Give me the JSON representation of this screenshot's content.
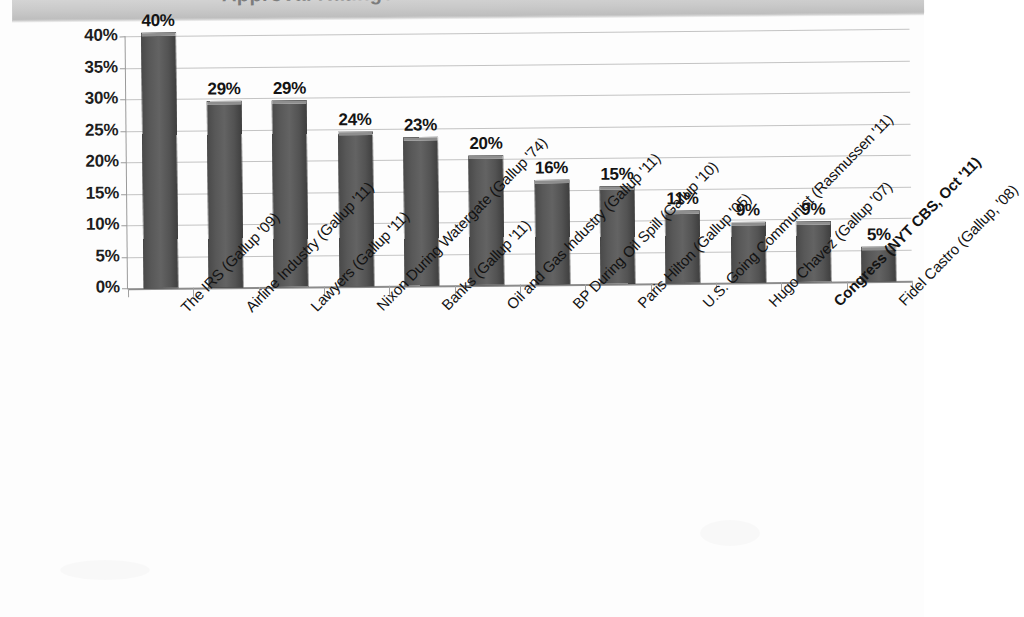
{
  "header": {
    "title_cropped": "Approval Ratings"
  },
  "chart_data": {
    "type": "bar",
    "title": "",
    "xlabel": "",
    "ylabel": "",
    "ylim": [
      0,
      40
    ],
    "ytick_labels": [
      "40%",
      "35%",
      "30%",
      "25%",
      "20%",
      "15%",
      "10%",
      "5%",
      "0%"
    ],
    "ytick_values": [
      40,
      35,
      30,
      25,
      20,
      15,
      10,
      5,
      0
    ],
    "grid": true,
    "legend": "none",
    "categories": [
      "The IRS (Gallup '09)",
      "Airline Industry (Gallup '11)",
      "Lawyers (Gallup '11)",
      "Nixon During Watergate (Gallup '74)",
      "Banks (Gallup '11)",
      "Oil and Gas Industry (Gallup '11)",
      "BP During Oil Spill (Gallup '10)",
      "Paris Hilton (Gallup '05)",
      "U.S. Going Communist (Rasmussen '11)",
      "Hugo Chavez (Gallup '07)",
      "Congress (NYT CBS, Oct '11)",
      "Fidel Castro (Gallup, '08)"
    ],
    "emphasized_category": "Congress (NYT CBS, Oct '11)",
    "values": [
      40,
      29,
      29,
      24,
      23,
      20,
      16,
      15,
      11,
      9,
      9,
      5
    ],
    "value_labels": [
      "40%",
      "29%",
      "29%",
      "24%",
      "23%",
      "20%",
      "16%",
      "15%",
      "11%",
      "9%",
      "9%",
      "5%"
    ],
    "bar_color": "#585858",
    "bar_cap_color": "#9d9d9d",
    "gridline_color": "#c3c3c3",
    "text_color": "#141414"
  }
}
